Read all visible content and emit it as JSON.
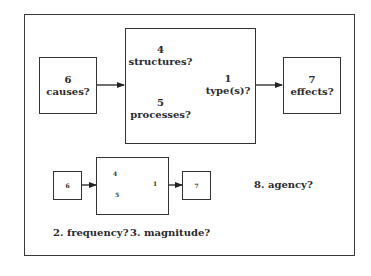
{
  "main_diagram": {
    "causes": {
      "num": "6",
      "text": "causes?"
    },
    "structures": {
      "num": "4",
      "text": "structures?"
    },
    "processes": {
      "num": "5",
      "text": "processes?"
    },
    "types": {
      "num": "1",
      "text": "type(s)?"
    },
    "effects": {
      "num": "7",
      "text": "effects?"
    }
  },
  "small_diagram": {
    "causes_num": "6",
    "structures_num": "4",
    "processes_num": "5",
    "types_num": "1",
    "effects_num": "7"
  },
  "notes": {
    "agency": "8.  agency?",
    "frequency": "2.  frequency?",
    "magnitude": "3.  magnitude?"
  }
}
